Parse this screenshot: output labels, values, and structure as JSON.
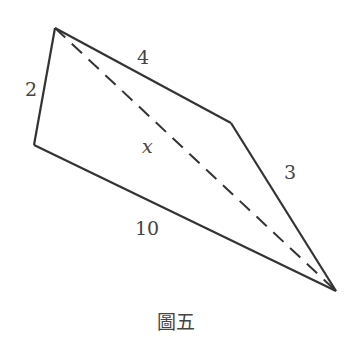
{
  "figure": {
    "caption": "圖五",
    "vertices": [
      "top-left",
      "bottom-left",
      "bottom-right",
      "middle-right"
    ],
    "edges": [
      {
        "name": "left-edge",
        "label": "2"
      },
      {
        "name": "top-edge",
        "label": "4"
      },
      {
        "name": "right-edge",
        "label": "3"
      },
      {
        "name": "bottom-edge",
        "label": "10"
      }
    ],
    "diagonal": {
      "label": "x",
      "style": "dashed"
    },
    "colors": {
      "stroke": "#333333",
      "text": "#444444"
    }
  }
}
